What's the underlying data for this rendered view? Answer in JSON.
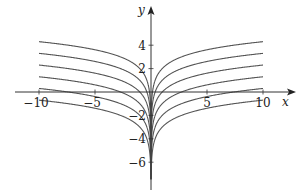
{
  "chart_data": {
    "type": "line",
    "title": "",
    "xlabel": "x",
    "ylabel": "y",
    "xlim": [
      -10,
      10
    ],
    "ylim": [
      -7.5,
      5.5
    ],
    "grid": false,
    "legend": null,
    "x_ticks": [
      -10,
      -5,
      5,
      10
    ],
    "x_tick_labels": [
      "−10",
      "−5",
      "5",
      "10"
    ],
    "y_ticks": [
      4,
      2,
      -2,
      -4,
      -6
    ],
    "y_tick_labels": [
      "4",
      "2",
      "−2",
      "−4",
      "−6"
    ],
    "function": "y = ln|x| + C",
    "series": [
      {
        "name": "C = 2",
        "C": 2
      },
      {
        "name": "C = 1",
        "C": 1
      },
      {
        "name": "C = 0",
        "C": 0
      },
      {
        "name": "C = -1",
        "C": -1
      },
      {
        "name": "C = -2",
        "C": -2
      },
      {
        "name": "C = -3",
        "C": -3
      }
    ],
    "curve_color": "#555555",
    "axis_color": "#333333"
  }
}
